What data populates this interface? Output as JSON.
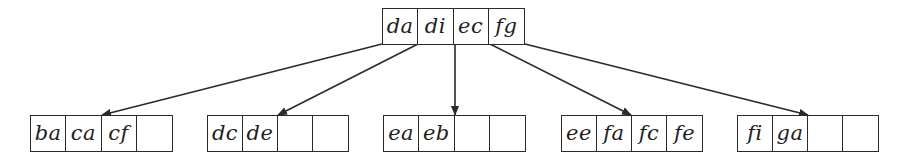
{
  "diagram": {
    "type": "b-tree",
    "root": {
      "keys": [
        "da",
        "di",
        "ec",
        "fg"
      ],
      "box": {
        "x": 382,
        "y": 8,
        "w": 143,
        "h": 37
      }
    },
    "leaves": [
      {
        "keys": [
          "ba",
          "ca",
          "cf",
          ""
        ],
        "box": {
          "x": 30,
          "y": 115,
          "w": 143,
          "h": 37
        }
      },
      {
        "keys": [
          "dc",
          "de",
          "",
          ""
        ],
        "box": {
          "x": 207,
          "y": 115,
          "w": 142,
          "h": 37
        }
      },
      {
        "keys": [
          "ea",
          "eb",
          "",
          ""
        ],
        "box": {
          "x": 383,
          "y": 115,
          "w": 143,
          "h": 37
        }
      },
      {
        "keys": [
          "ee",
          "fa",
          "fc",
          "fe"
        ],
        "box": {
          "x": 561,
          "y": 115,
          "w": 142,
          "h": 37
        }
      },
      {
        "keys": [
          "fi",
          "ga",
          "",
          ""
        ],
        "box": {
          "x": 737,
          "y": 115,
          "w": 142,
          "h": 37
        }
      }
    ],
    "edges": [
      {
        "from": [
          382,
          44
        ],
        "to": [
          102,
          115
        ],
        "label": "root-to-leaf-1"
      },
      {
        "from": [
          418,
          44
        ],
        "to": [
          278,
          115
        ],
        "label": "root-to-leaf-2"
      },
      {
        "from": [
          455,
          44
        ],
        "to": [
          455,
          115
        ],
        "label": "root-to-leaf-3"
      },
      {
        "from": [
          490,
          44
        ],
        "to": [
          631,
          115
        ],
        "label": "root-to-leaf-4"
      },
      {
        "from": [
          525,
          44
        ],
        "to": [
          808,
          115
        ],
        "label": "root-to-leaf-5"
      }
    ],
    "colors": {
      "stroke": "#2a2a2a",
      "text": "#1e1e1e",
      "background": "#ffffff"
    }
  }
}
